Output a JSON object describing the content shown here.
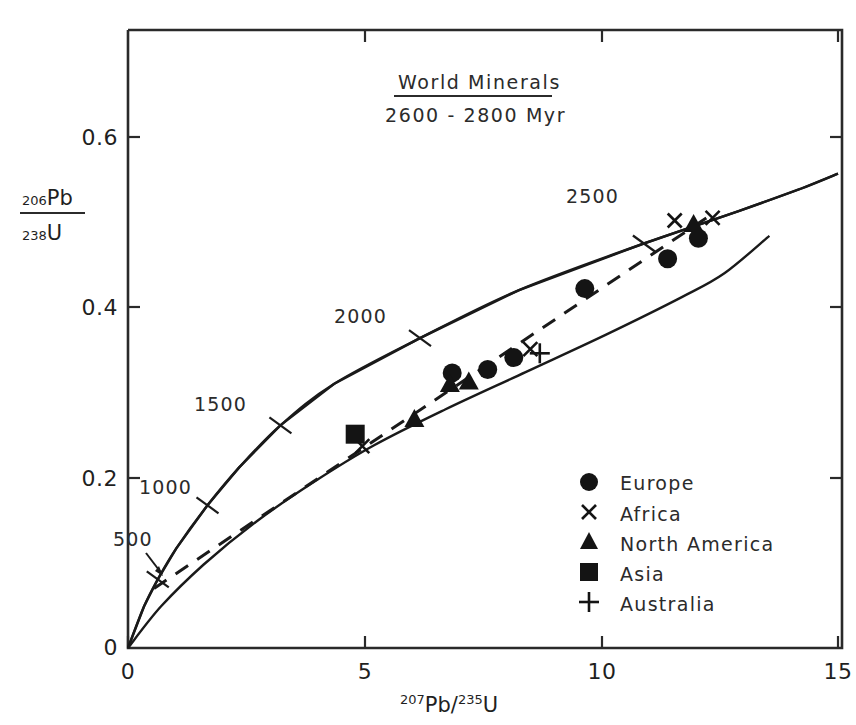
{
  "chart_data": {
    "type": "scatter",
    "title": "World Minerals",
    "subtitle": "2600 - 2800 Myr",
    "xlabel": "207Pb/235U",
    "ylabel": "206Pb/238U",
    "xlabel_parts": {
      "sup1": "207",
      "mid": "Pb/",
      "sup2": "235",
      "tail": "U"
    },
    "ylabel_parts": {
      "num_sup": "206",
      "num": "Pb",
      "den_sup": "238",
      "den": "U"
    },
    "xlim": [
      0,
      15
    ],
    "ylim": [
      0,
      0.68
    ],
    "xticks": [
      0,
      5,
      10,
      15
    ],
    "xticklabels": [
      "0",
      "5",
      "10",
      "15"
    ],
    "yticks": [
      0,
      0.2,
      0.4,
      0.6
    ],
    "yticklabels": [
      "0",
      "0.2",
      "0.4",
      "0.6"
    ],
    "grid": false,
    "legend_position": "lower-right",
    "concordia": {
      "name": "Concordia curve",
      "age_markers": [
        {
          "label": "500",
          "x": 0.63,
          "y": 0.0807
        },
        {
          "label": "1000",
          "x": 1.68,
          "y": 0.1675
        },
        {
          "label": "1500",
          "x": 3.22,
          "y": 0.2614
        },
        {
          "label": "2000",
          "x": 6.17,
          "y": 0.3639
        },
        {
          "label": "2500",
          "x": 10.9,
          "y": 0.475
        }
      ],
      "points": [
        {
          "x": 0.0,
          "y": 0.0
        },
        {
          "x": 0.34,
          "y": 0.049
        },
        {
          "x": 0.63,
          "y": 0.0807
        },
        {
          "x": 1.02,
          "y": 0.117
        },
        {
          "x": 1.68,
          "y": 0.1675
        },
        {
          "x": 2.35,
          "y": 0.212
        },
        {
          "x": 3.22,
          "y": 0.2614
        },
        {
          "x": 4.35,
          "y": 0.31
        },
        {
          "x": 6.17,
          "y": 0.3639
        },
        {
          "x": 8.25,
          "y": 0.42
        },
        {
          "x": 10.9,
          "y": 0.475
        },
        {
          "x": 12.9,
          "y": 0.513
        },
        {
          "x": 14.2,
          "y": 0.539
        },
        {
          "x": 15.0,
          "y": 0.557
        }
      ]
    },
    "lower_curve": {
      "name": "Lower reference curve",
      "points": [
        {
          "x": 0.0,
          "y": 0.0
        },
        {
          "x": 0.7,
          "y": 0.049
        },
        {
          "x": 1.6,
          "y": 0.098
        },
        {
          "x": 2.7,
          "y": 0.148
        },
        {
          "x": 3.9,
          "y": 0.194
        },
        {
          "x": 5.2,
          "y": 0.238
        },
        {
          "x": 6.7,
          "y": 0.28
        },
        {
          "x": 8.4,
          "y": 0.324
        },
        {
          "x": 10.1,
          "y": 0.368
        },
        {
          "x": 11.7,
          "y": 0.412
        },
        {
          "x": 12.6,
          "y": 0.44
        },
        {
          "x": 13.55,
          "y": 0.484
        }
      ]
    },
    "discordia": {
      "name": "Discordia (dashed) chord",
      "style": "dashed",
      "from": {
        "x": 0.55,
        "y": 0.07
      },
      "to": {
        "x": 12.3,
        "y": 0.508
      }
    },
    "series": [
      {
        "name": "Europe",
        "marker": "circle",
        "points": [
          {
            "x": 6.85,
            "y": 0.323
          },
          {
            "x": 7.6,
            "y": 0.327
          },
          {
            "x": 8.15,
            "y": 0.341
          },
          {
            "x": 9.65,
            "y": 0.422
          },
          {
            "x": 11.4,
            "y": 0.457
          },
          {
            "x": 12.05,
            "y": 0.481
          }
        ]
      },
      {
        "name": "Africa",
        "marker": "cross",
        "points": [
          {
            "x": 4.95,
            "y": 0.237
          },
          {
            "x": 8.5,
            "y": 0.351
          },
          {
            "x": 11.55,
            "y": 0.502
          },
          {
            "x": 12.35,
            "y": 0.505
          }
        ]
      },
      {
        "name": "North America",
        "marker": "triangle",
        "points": [
          {
            "x": 6.05,
            "y": 0.27
          },
          {
            "x": 6.8,
            "y": 0.311
          },
          {
            "x": 7.2,
            "y": 0.314
          },
          {
            "x": 11.95,
            "y": 0.499
          }
        ]
      },
      {
        "name": "Asia",
        "marker": "square",
        "points": [
          {
            "x": 4.8,
            "y": 0.251
          }
        ]
      },
      {
        "name": "Australia",
        "marker": "plus",
        "points": [
          {
            "x": 8.7,
            "y": 0.346
          }
        ]
      }
    ],
    "legend": [
      {
        "marker": "circle",
        "label": "Europe"
      },
      {
        "marker": "cross",
        "label": "Africa"
      },
      {
        "marker": "triangle",
        "label": "North America"
      },
      {
        "marker": "square",
        "label": "Asia"
      },
      {
        "marker": "plus",
        "label": "Australia"
      }
    ],
    "colors": {
      "ink": "#141414",
      "frame": "#2a2a2a",
      "background": "#ffffff"
    }
  }
}
